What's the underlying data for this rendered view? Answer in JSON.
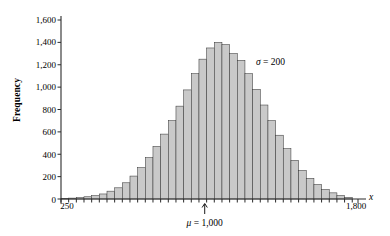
{
  "chart_data": {
    "type": "bar",
    "title": "",
    "subtitle": "",
    "xlabel": "x",
    "ylabel": "Frequency",
    "xlim": [
      250,
      1800
    ],
    "ylim": [
      0,
      1600
    ],
    "grid": false,
    "legend_position": "none",
    "y_ticks": [
      0,
      200,
      400,
      600,
      800,
      1000,
      1200,
      1400,
      1600
    ],
    "y_tick_labels": [
      "0",
      "200",
      "400",
      "600",
      "800",
      "1,000",
      "1,200",
      "1,400",
      "1,600"
    ],
    "x_ticks": [
      250,
      1800
    ],
    "x_tick_labels": [
      "250",
      "1,800"
    ],
    "bar_width": 40,
    "categories": [
      270,
      310,
      350,
      390,
      430,
      470,
      510,
      550,
      590,
      630,
      670,
      710,
      750,
      790,
      830,
      870,
      910,
      950,
      990,
      1030,
      1070,
      1110,
      1150,
      1190,
      1230,
      1270,
      1310,
      1350,
      1390,
      1430,
      1470,
      1510,
      1550,
      1590,
      1630,
      1670,
      1710,
      1750
    ],
    "values": [
      5,
      8,
      12,
      20,
      30,
      45,
      70,
      100,
      145,
      205,
      280,
      370,
      470,
      580,
      700,
      830,
      975,
      1120,
      1250,
      1350,
      1400,
      1380,
      1300,
      1240,
      1120,
      980,
      840,
      700,
      570,
      450,
      345,
      255,
      185,
      130,
      85,
      55,
      32,
      15
    ],
    "annotations": [
      {
        "name": "sigma",
        "symbol": "σ",
        "text": " = 200",
        "x": 1430,
        "y": 1270
      },
      {
        "name": "mu",
        "symbol": "μ",
        "text": " = 1,000",
        "x": 1000,
        "y": -220,
        "arrow": true
      }
    ]
  },
  "labels": {
    "y_axis_title": "Frequency",
    "x_axis_title": "x",
    "x_left_tick": "250",
    "x_right_tick": "1,800",
    "y_tick_0": "0",
    "y_tick_200": "200",
    "y_tick_400": "400",
    "y_tick_600": "600",
    "y_tick_800": "800",
    "y_tick_1000": "1,000",
    "y_tick_1200": "1,200",
    "y_tick_1400": "1,400",
    "y_tick_1600": "1,600",
    "sigma_symbol": "σ",
    "sigma_value": " = 200",
    "mu_symbol": "μ",
    "mu_value": " = 1,000"
  },
  "colors": {
    "bar_fill": "#c9c9c9",
    "bar_stroke": "#3a3a3a",
    "axis": "#2b2b2b",
    "background": "#ffffff",
    "text": "#000000"
  }
}
